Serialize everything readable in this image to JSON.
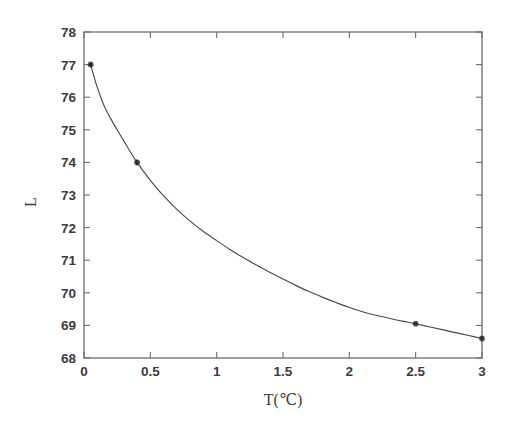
{
  "chart_data": {
    "type": "line",
    "title": "",
    "subtitle": "",
    "xlabel": "T(℃)",
    "ylabel": "L",
    "xlim": [
      0,
      3
    ],
    "ylim": [
      68,
      78
    ],
    "xticks": [
      "0",
      "0.5",
      "1",
      "1.5",
      "2",
      "2.5",
      "3"
    ],
    "xtick_values": [
      0,
      0.5,
      1,
      1.5,
      2,
      2.5,
      3
    ],
    "yticks": [
      "68",
      "69",
      "70",
      "71",
      "72",
      "73",
      "74",
      "75",
      "76",
      "77",
      "78"
    ],
    "ytick_values": [
      68,
      69,
      70,
      71,
      72,
      73,
      74,
      75,
      76,
      77,
      78
    ],
    "grid": false,
    "legend": null,
    "legend_position": "none",
    "box": true,
    "tick_direction": "in",
    "marker_style": "star",
    "line_color": "#4a4a4a",
    "marker_color": "#2b2b2b",
    "axis_color": "#6e6e6e",
    "background": "#ffffff",
    "series": [
      {
        "name": "L vs T",
        "marker_points": {
          "x": [
            0.05,
            0.4,
            2.5,
            3.0
          ],
          "y": [
            77.0,
            74.0,
            69.05,
            68.6
          ]
        },
        "x": [
          0.05,
          0.1,
          0.15,
          0.2,
          0.25,
          0.3,
          0.35,
          0.4,
          0.5,
          0.6,
          0.7,
          0.8,
          0.9,
          1.0,
          1.1,
          1.2,
          1.3,
          1.4,
          1.5,
          1.6,
          1.7,
          1.8,
          1.9,
          2.0,
          2.1,
          2.2,
          2.3,
          2.4,
          2.5,
          2.6,
          2.7,
          2.8,
          2.9,
          3.0
        ],
        "y": [
          77.0,
          76.3,
          75.75,
          75.35,
          75.0,
          74.66,
          74.32,
          74.0,
          73.45,
          72.97,
          72.56,
          72.2,
          71.88,
          71.6,
          71.33,
          71.08,
          70.85,
          70.63,
          70.42,
          70.22,
          70.03,
          69.86,
          69.7,
          69.55,
          69.42,
          69.31,
          69.22,
          69.13,
          69.05,
          68.96,
          68.87,
          68.78,
          68.69,
          68.6
        ]
      }
    ],
    "annotations": []
  },
  "figure": {
    "name": "l-vs-t-decay-plot"
  }
}
